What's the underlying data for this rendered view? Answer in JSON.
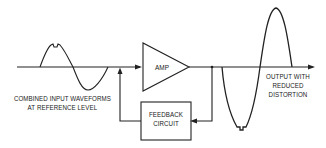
{
  "diagram": {
    "blocks": {
      "amplifier": {
        "label": "AMP"
      },
      "feedback": {
        "line1": "FEEDBACK",
        "line2": "CIRCUIT"
      }
    },
    "labels": {
      "input": {
        "line1": "COMBINED INPUT WAVEFORMS",
        "line2": "AT REFERENCE LEVEL"
      },
      "output": {
        "line1": "OUTPUT WITH",
        "line2": "REDUCED",
        "line3": "DISTORTION"
      }
    },
    "colors": {
      "stroke": "#222222",
      "background": "#ffffff"
    }
  }
}
